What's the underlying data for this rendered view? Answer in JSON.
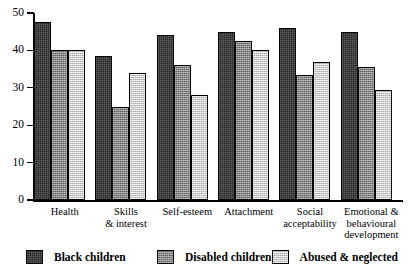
{
  "chart_data": {
    "type": "bar",
    "title": "",
    "subtitle": "",
    "xlabel": "",
    "ylabel": "",
    "ylim": [
      0,
      50
    ],
    "yticks": [
      0,
      10,
      20,
      30,
      40,
      50
    ],
    "ytick_labels": [
      "0",
      "10",
      "20",
      "30",
      "40",
      "50"
    ],
    "grid": false,
    "legend_position": "bottom",
    "categories": [
      "Health",
      "Skills\n& interest",
      "Self-esteem",
      "Attachment",
      "Social\nacceptability",
      "Emotional &\nbehavioural\ndevelopment"
    ],
    "series": [
      {
        "name": "Black children",
        "color": "#272727",
        "values": [
          47.5,
          38.5,
          44,
          45,
          46,
          44.8
        ]
      },
      {
        "name": "Disabled children",
        "color": "#8d8d8d",
        "values": [
          40,
          25,
          36,
          42.5,
          33.5,
          35.5
        ]
      },
      {
        "name": "Abused & neglected",
        "color": "#dcdcdc",
        "values": [
          40,
          34,
          28,
          40,
          37,
          29.5
        ]
      }
    ]
  },
  "legend": {
    "items": [
      {
        "label": "Black children",
        "swatch": "#272727"
      },
      {
        "label": "Disabled children",
        "swatch": "#8d8d8d"
      },
      {
        "label": "Abused & neglected",
        "swatch": "#dcdcdc"
      }
    ]
  }
}
